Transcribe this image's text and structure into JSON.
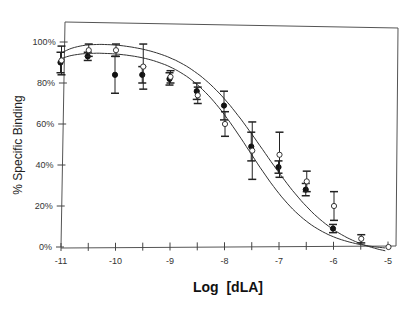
{
  "chart_data": {
    "type": "scatter",
    "title": "",
    "xlabel": "Log  [dLA]",
    "ylabel": "% Specific Binding",
    "xlim": [
      -11,
      -5
    ],
    "ylim": [
      0,
      110
    ],
    "x_ticks": [
      -11,
      -10,
      -9,
      -8,
      -7,
      -6,
      -5
    ],
    "x_tick_labels": [
      "-11",
      "-10",
      "-9",
      "-8",
      "-7",
      "-6",
      "-5"
    ],
    "x_minor_ticks": [
      -10.5,
      -9.5,
      -8.5,
      -7.5,
      -6.5,
      -5.5
    ],
    "y_ticks": [
      0,
      20,
      40,
      60,
      80,
      100
    ],
    "y_tick_labels": [
      "0%",
      "20%",
      "40%",
      "60%",
      "80%",
      "100%"
    ],
    "grid": false,
    "legend": null,
    "series": [
      {
        "name": "filled",
        "marker": "filled-circle",
        "x": [
          -11,
          -10.5,
          -10,
          -9.5,
          -9,
          -8.5,
          -8,
          -7.5,
          -7,
          -6.5,
          -6
        ],
        "values": [
          90,
          93,
          84,
          84,
          82,
          76,
          69,
          49,
          39,
          28,
          9
        ],
        "error": [
          5,
          2,
          9,
          4,
          3,
          4,
          7,
          7,
          3,
          3,
          2
        ],
        "fit_curve": "sigmoid"
      },
      {
        "name": "open",
        "marker": "open-circle",
        "x": [
          -11,
          -10.5,
          -10,
          -9.5,
          -9,
          -8.5,
          -8,
          -7.5,
          -7,
          -6.5,
          -6,
          -5.5,
          -5
        ],
        "values": [
          91,
          96,
          96,
          88,
          83,
          74,
          60,
          47,
          45,
          32,
          20,
          4,
          0
        ],
        "error": [
          7,
          3,
          3,
          11,
          3,
          4,
          6,
          14,
          11,
          5,
          7,
          2,
          0
        ],
        "fit_curve": "sigmoid"
      }
    ]
  },
  "labels": {
    "ylabel": "% Specific Binding",
    "xlabel": "Log  [dLA]"
  }
}
